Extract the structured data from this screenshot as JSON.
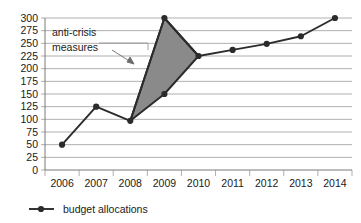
{
  "chart_data": {
    "type": "line",
    "title": "",
    "xlabel": "",
    "ylabel": "",
    "categories": [
      "2006",
      "2007",
      "2008",
      "2009",
      "2010",
      "2011",
      "2012",
      "2013",
      "2014"
    ],
    "series": [
      {
        "name": "budget allocations",
        "values": [
          50,
          125,
          97,
          300,
          225,
          237,
          249,
          264,
          300
        ]
      },
      {
        "name": "pre-crisis trend",
        "values": [
          null,
          null,
          97,
          150,
          225,
          null,
          null,
          null,
          null
        ]
      }
    ],
    "ylim": [
      0,
      300
    ],
    "ytick_values": [
      0,
      25,
      50,
      75,
      100,
      125,
      150,
      175,
      200,
      225,
      250,
      275,
      300
    ],
    "ytick_labels": [
      "0",
      "25",
      "50",
      "75",
      "100",
      "125",
      "150",
      "175",
      "200",
      "225",
      "250",
      "275",
      "300"
    ],
    "grid": true,
    "legend_position": "bottom-left",
    "annotations": [
      {
        "name": "anti-crisis-measures",
        "line1": "anti-crisis",
        "line2": "measures",
        "points_to": "2009 peak region"
      }
    ],
    "shaded_region": {
      "name": "anti-crisis-area",
      "color": "#8a8a8a",
      "vertices": [
        {
          "x": "2008",
          "y": 97
        },
        {
          "x": "2009",
          "y": 300
        },
        {
          "x": "2010",
          "y": 225
        },
        {
          "x": "2009",
          "y": 150
        }
      ]
    },
    "colors": {
      "line": "#2b2b2b",
      "shade": "#8a8a8a",
      "grid": "#8e8e8e",
      "axis": "#6b6b6b",
      "text": "#1a1a1a",
      "background": "#ffffff"
    }
  },
  "legend": {
    "items": [
      {
        "label": "budget allocations"
      }
    ]
  }
}
